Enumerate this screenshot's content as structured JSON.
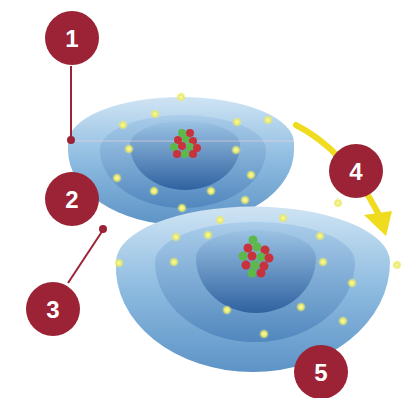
{
  "diagram": {
    "title": "",
    "colors": {
      "callout": "#9b2335",
      "shell_light": "#b9d8ee",
      "shell_mid": "#7fb0d8",
      "shell_dark": "#3a6fa8",
      "electron": "#f2f27a",
      "arrow": "#f0dc1e",
      "proton": "#c8323c",
      "neutron": "#5db84a"
    },
    "atoms": [
      {
        "name": "upper-atom",
        "shells": 3,
        "electrons_visible": 12
      },
      {
        "name": "lower-atom",
        "shells": 3,
        "electrons_visible": 16
      }
    ],
    "callouts": [
      {
        "label": "1",
        "target": "upper atom outer shell edge"
      },
      {
        "label": "2",
        "target": "upper atom shell"
      },
      {
        "label": "3",
        "target": "upper atom lower edge"
      },
      {
        "label": "4",
        "target": "transition arrow"
      },
      {
        "label": "5",
        "target": "lower atom outer shell"
      }
    ]
  }
}
